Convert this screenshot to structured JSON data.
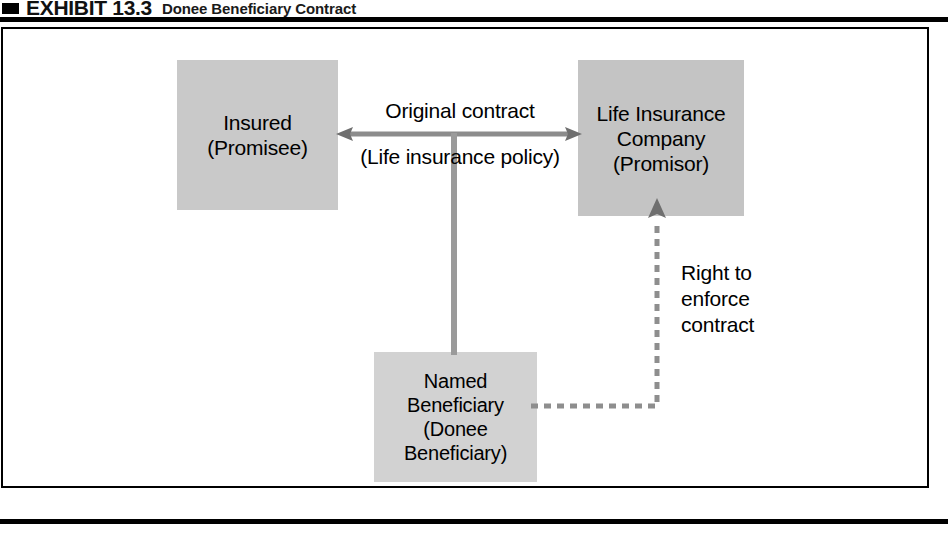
{
  "header": {
    "marker_icon": "black-square-bullet",
    "exhibit_label": "EXHIBIT 13.3",
    "subtitle": "Donee Beneficiary Contract"
  },
  "diagram": {
    "type": "flow-diagram",
    "title": "Donee Beneficiary Contract",
    "nodes": [
      {
        "id": "insured",
        "label": "Insured\n(Promisee)",
        "role": "Promisee",
        "fill": "#c9c9c9"
      },
      {
        "id": "insurer",
        "label": "Life Insurance\nCompany\n(Promisor)",
        "role": "Promisor",
        "fill": "#c4c4c4"
      },
      {
        "id": "beneficiary",
        "label": "Named\nBeneficiary\n(Donee\nBeneficiary)",
        "role": "Donee Beneficiary",
        "fill": "#d2d2d2"
      }
    ],
    "edges": [
      {
        "id": "original-contract",
        "from": "insured",
        "to": "insurer",
        "style": "solid-double-arrow",
        "label_above": "Original contract",
        "label_below": "(Life insurance policy)"
      },
      {
        "id": "beneficiary-link",
        "from": "original-contract",
        "to": "beneficiary",
        "style": "solid-line",
        "label": ""
      },
      {
        "id": "right-to-enforce",
        "from": "beneficiary",
        "to": "insurer",
        "style": "dashed-arrow",
        "label": "Right to\nenforce\ncontract"
      }
    ],
    "colors": {
      "node_fill": "#c9c9c9",
      "node_shadow": "#e2e2e2",
      "connector": "#8c8c8c",
      "frame": "#000000",
      "text": "#000000"
    }
  }
}
